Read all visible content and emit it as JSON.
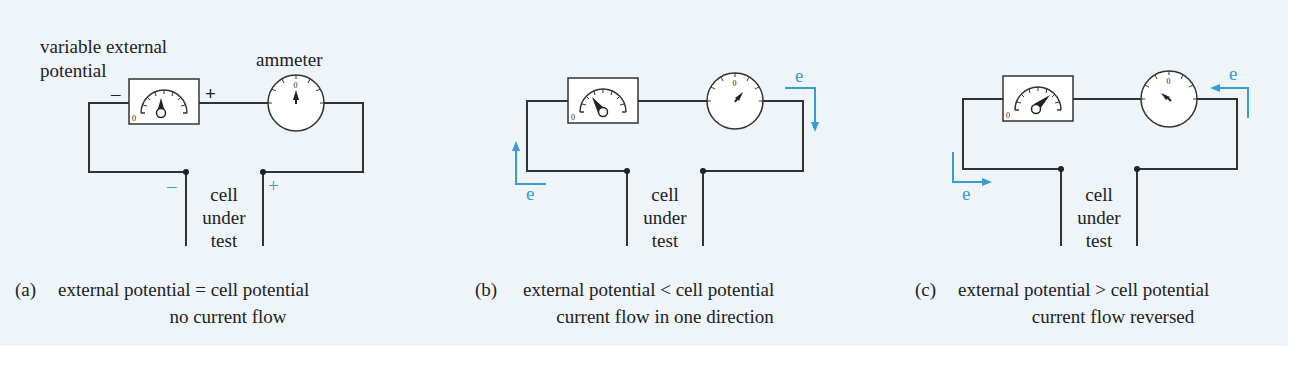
{
  "labels": {
    "variable_external_line1": "variable external",
    "variable_external_line2": "potential",
    "ammeter": "ammeter",
    "minus": "–",
    "plus": "+",
    "cell_line1": "cell",
    "cell_line2": "under",
    "cell_line3": "test",
    "electron": "e",
    "zero": "0"
  },
  "panels": [
    {
      "id": "a",
      "caption_letter": "(a)",
      "caption_line1": "external potential = cell potential",
      "caption_line2": "no current flow"
    },
    {
      "id": "b",
      "caption_letter": "(b)",
      "caption_line1": "external potential < cell potential",
      "caption_line2": "current flow in one direction"
    },
    {
      "id": "c",
      "caption_letter": "(c)",
      "caption_line1": "external potential > cell potential",
      "caption_line2": "current flow reversed"
    }
  ],
  "colors": {
    "background": "#eef4f7",
    "wire": "#333333",
    "electron_arrow": "#3a9ad4"
  }
}
